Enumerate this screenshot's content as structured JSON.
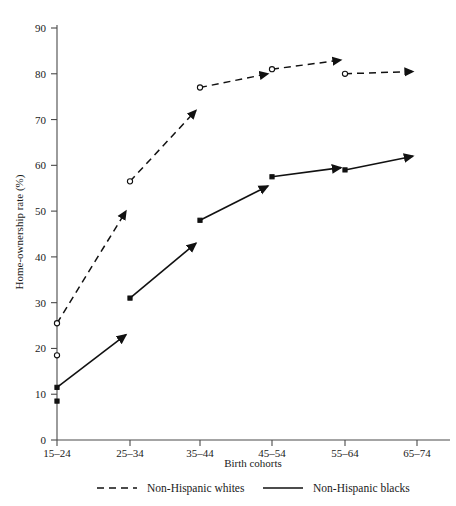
{
  "chart_data": {
    "type": "line",
    "title": "",
    "xlabel": "Birth cohorts",
    "ylabel": "Home-ownership rate (%)",
    "categories": [
      "15–24",
      "25–34",
      "35–44",
      "45–54",
      "55–64",
      "65–74"
    ],
    "ylim": [
      0,
      90
    ],
    "yticks": [
      0,
      10,
      20,
      30,
      40,
      50,
      60,
      70,
      80,
      90
    ],
    "ytick_labels": [
      "0",
      "10",
      "20",
      "30",
      "40",
      "50",
      "60",
      "70",
      "80",
      "90"
    ],
    "grid": false,
    "legend_position": "bottom",
    "series": [
      {
        "name": "Non-Hispanic whites",
        "style": "dashed",
        "marker": "open-circle",
        "cohort_start_values": [
          25.5,
          56.5,
          77.0,
          81.0,
          80.0
        ],
        "cohort_end_values": [
          50.0,
          72.0,
          80.0,
          83.0,
          80.5
        ],
        "extra_marker": {
          "cohort": "15–24",
          "value": 18.5
        }
      },
      {
        "name": "Non-Hispanic blacks",
        "style": "solid",
        "marker": "filled-square",
        "cohort_start_values": [
          11.5,
          31.0,
          48.0,
          57.5,
          59.0
        ],
        "cohort_end_values": [
          23.0,
          43.0,
          55.5,
          59.5,
          62.0
        ],
        "extra_marker": {
          "cohort": "15–24",
          "value": 8.5
        }
      }
    ]
  },
  "legend": {
    "items": [
      {
        "label": "Non-Hispanic whites",
        "style": "dashed"
      },
      {
        "label": "Non-Hispanic blacks",
        "style": "solid"
      }
    ]
  },
  "axes": {
    "y_title": "Home-ownership rate (%)",
    "x_title": "Birth cohorts"
  }
}
